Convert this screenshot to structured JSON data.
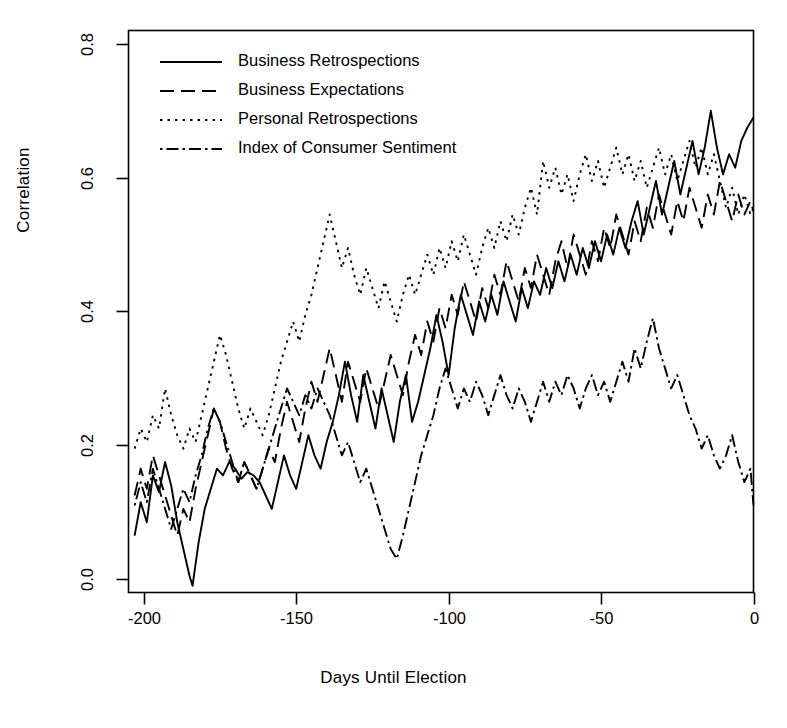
{
  "chart_data": {
    "type": "line",
    "title": "",
    "xlabel": "Days Until Election",
    "ylabel": "Correlation",
    "xlim": [
      -205,
      0
    ],
    "ylim": [
      -0.02,
      0.82
    ],
    "xticks": [
      -200,
      -150,
      -100,
      -50,
      0
    ],
    "xtick_labels": [
      "-200",
      "-150",
      "-100",
      "-50",
      "0"
    ],
    "yticks": [
      0.0,
      0.2,
      0.4,
      0.6,
      0.8
    ],
    "ytick_labels": [
      "0.0",
      "0.2",
      "0.4",
      "0.6",
      "0.8"
    ],
    "grid": false,
    "legend_position": "top-left",
    "line_color": "#000000",
    "series": [
      {
        "name": "Business Retrospections",
        "dash": "solid",
        "x": [
          -203,
          -201,
          -199,
          -197,
          -195,
          -193,
          -191,
          -189,
          -187,
          -185,
          -184,
          -182,
          -180,
          -178,
          -176,
          -174,
          -172,
          -170,
          -168,
          -166,
          -164,
          -162,
          -160,
          -158,
          -156,
          -154,
          -152,
          -150,
          -148,
          -146,
          -144,
          -142,
          -140,
          -138,
          -136,
          -134,
          -132,
          -130,
          -128,
          -126,
          -124,
          -122,
          -120,
          -118,
          -116,
          -114,
          -112,
          -110,
          -108,
          -106,
          -104,
          -102,
          -100,
          -98,
          -96,
          -94,
          -92,
          -90,
          -88,
          -86,
          -84,
          -82,
          -80,
          -78,
          -76,
          -74,
          -72,
          -70,
          -68,
          -66,
          -64,
          -62,
          -60,
          -58,
          -56,
          -54,
          -52,
          -50,
          -48,
          -46,
          -44,
          -42,
          -40,
          -38,
          -36,
          -34,
          -32,
          -30,
          -28,
          -26,
          -24,
          -22,
          -20,
          -18,
          -16,
          -14,
          -12,
          -10,
          -8,
          -6,
          -4,
          -2,
          0
        ],
        "y": [
          0.065,
          0.115,
          0.085,
          0.155,
          0.13,
          0.175,
          0.14,
          0.085,
          0.045,
          0.005,
          -0.01,
          0.055,
          0.105,
          0.135,
          0.165,
          0.155,
          0.175,
          0.165,
          0.15,
          0.16,
          0.155,
          0.145,
          0.125,
          0.105,
          0.145,
          0.185,
          0.155,
          0.135,
          0.175,
          0.215,
          0.185,
          0.165,
          0.205,
          0.235,
          0.275,
          0.325,
          0.275,
          0.235,
          0.305,
          0.265,
          0.225,
          0.285,
          0.245,
          0.205,
          0.265,
          0.305,
          0.235,
          0.265,
          0.305,
          0.345,
          0.395,
          0.355,
          0.305,
          0.375,
          0.425,
          0.395,
          0.365,
          0.415,
          0.385,
          0.425,
          0.395,
          0.445,
          0.415,
          0.385,
          0.435,
          0.405,
          0.445,
          0.425,
          0.465,
          0.435,
          0.475,
          0.445,
          0.485,
          0.455,
          0.495,
          0.465,
          0.505,
          0.475,
          0.515,
          0.485,
          0.525,
          0.495,
          0.535,
          0.565,
          0.515,
          0.555,
          0.595,
          0.545,
          0.585,
          0.625,
          0.575,
          0.615,
          0.655,
          0.605,
          0.645,
          0.7,
          0.645,
          0.605,
          0.635,
          0.615,
          0.655,
          0.675,
          0.69
        ]
      },
      {
        "name": "Business Expectations",
        "dash": "longdash",
        "x": [
          -203,
          -201,
          -199,
          -197,
          -195,
          -193,
          -191,
          -189,
          -187,
          -185,
          -183,
          -181,
          -179,
          -177,
          -175,
          -173,
          -171,
          -169,
          -167,
          -165,
          -163,
          -161,
          -159,
          -157,
          -155,
          -153,
          -151,
          -149,
          -147,
          -145,
          -143,
          -141,
          -139,
          -137,
          -135,
          -133,
          -131,
          -129,
          -127,
          -125,
          -123,
          -121,
          -119,
          -117,
          -115,
          -113,
          -111,
          -109,
          -107,
          -105,
          -103,
          -101,
          -99,
          -97,
          -95,
          -93,
          -91,
          -89,
          -87,
          -85,
          -83,
          -81,
          -79,
          -77,
          -75,
          -73,
          -71,
          -69,
          -67,
          -65,
          -63,
          -61,
          -59,
          -57,
          -55,
          -53,
          -51,
          -49,
          -47,
          -45,
          -43,
          -41,
          -39,
          -37,
          -35,
          -33,
          -31,
          -29,
          -27,
          -25,
          -23,
          -21,
          -19,
          -17,
          -15,
          -13,
          -11,
          -9,
          -7,
          -5,
          -3,
          -1,
          0
        ],
        "y": [
          0.125,
          0.165,
          0.135,
          0.185,
          0.155,
          0.125,
          0.095,
          0.065,
          0.105,
          0.085,
          0.135,
          0.175,
          0.215,
          0.255,
          0.235,
          0.195,
          0.165,
          0.145,
          0.175,
          0.155,
          0.135,
          0.165,
          0.195,
          0.175,
          0.225,
          0.265,
          0.235,
          0.205,
          0.255,
          0.295,
          0.265,
          0.305,
          0.345,
          0.305,
          0.265,
          0.325,
          0.295,
          0.265,
          0.315,
          0.285,
          0.255,
          0.295,
          0.335,
          0.305,
          0.275,
          0.325,
          0.365,
          0.335,
          0.385,
          0.355,
          0.405,
          0.375,
          0.425,
          0.395,
          0.445,
          0.415,
          0.385,
          0.435,
          0.405,
          0.455,
          0.425,
          0.475,
          0.445,
          0.415,
          0.465,
          0.435,
          0.485,
          0.455,
          0.425,
          0.475,
          0.505,
          0.465,
          0.515,
          0.485,
          0.455,
          0.505,
          0.475,
          0.525,
          0.495,
          0.545,
          0.515,
          0.485,
          0.535,
          0.505,
          0.555,
          0.525,
          0.575,
          0.545,
          0.515,
          0.565,
          0.535,
          0.585,
          0.555,
          0.525,
          0.575,
          0.545,
          0.595,
          0.565,
          0.535,
          0.575,
          0.545,
          0.565,
          0.55
        ]
      },
      {
        "name": "Personal Retrospections",
        "dash": "dotted",
        "x": [
          -203,
          -201,
          -199,
          -197,
          -195,
          -193,
          -191,
          -189,
          -187,
          -185,
          -183,
          -181,
          -179,
          -177,
          -175,
          -173,
          -171,
          -169,
          -167,
          -165,
          -163,
          -161,
          -159,
          -157,
          -155,
          -153,
          -151,
          -149,
          -147,
          -145,
          -143,
          -141,
          -139,
          -137,
          -135,
          -133,
          -131,
          -129,
          -127,
          -125,
          -123,
          -121,
          -119,
          -117,
          -115,
          -113,
          -111,
          -109,
          -107,
          -105,
          -103,
          -101,
          -99,
          -97,
          -95,
          -93,
          -91,
          -89,
          -87,
          -85,
          -83,
          -81,
          -79,
          -77,
          -75,
          -73,
          -71,
          -69,
          -67,
          -65,
          -63,
          -61,
          -59,
          -57,
          -55,
          -53,
          -51,
          -49,
          -47,
          -45,
          -43,
          -41,
          -39,
          -37,
          -35,
          -33,
          -31,
          -29,
          -27,
          -25,
          -23,
          -21,
          -19,
          -17,
          -15,
          -13,
          -11,
          -9,
          -7,
          -5,
          -3,
          -1,
          0
        ],
        "y": [
          0.195,
          0.225,
          0.205,
          0.245,
          0.225,
          0.285,
          0.245,
          0.215,
          0.195,
          0.225,
          0.205,
          0.245,
          0.285,
          0.325,
          0.365,
          0.335,
          0.295,
          0.255,
          0.225,
          0.255,
          0.235,
          0.215,
          0.245,
          0.285,
          0.325,
          0.355,
          0.385,
          0.355,
          0.395,
          0.425,
          0.465,
          0.505,
          0.545,
          0.505,
          0.465,
          0.495,
          0.455,
          0.425,
          0.465,
          0.435,
          0.405,
          0.445,
          0.415,
          0.385,
          0.425,
          0.455,
          0.425,
          0.455,
          0.485,
          0.455,
          0.495,
          0.465,
          0.505,
          0.475,
          0.515,
          0.485,
          0.455,
          0.495,
          0.525,
          0.495,
          0.535,
          0.505,
          0.545,
          0.515,
          0.555,
          0.585,
          0.545,
          0.625,
          0.585,
          0.615,
          0.575,
          0.605,
          0.565,
          0.605,
          0.635,
          0.595,
          0.625,
          0.585,
          0.615,
          0.645,
          0.605,
          0.635,
          0.595,
          0.625,
          0.585,
          0.615,
          0.645,
          0.605,
          0.635,
          0.595,
          0.625,
          0.655,
          0.615,
          0.645,
          0.605,
          0.635,
          0.595,
          0.555,
          0.585,
          0.545,
          0.575,
          0.545,
          0.555
        ]
      },
      {
        "name": "Index of Consumer Sentiment",
        "dash": "dashdot",
        "x": [
          -203,
          -201,
          -199,
          -197,
          -195,
          -193,
          -191,
          -189,
          -187,
          -185,
          -183,
          -181,
          -179,
          -177,
          -175,
          -173,
          -171,
          -169,
          -167,
          -165,
          -163,
          -161,
          -159,
          -157,
          -155,
          -153,
          -151,
          -149,
          -147,
          -145,
          -143,
          -141,
          -139,
          -137,
          -135,
          -133,
          -131,
          -129,
          -127,
          -125,
          -123,
          -121,
          -119,
          -117,
          -115,
          -113,
          -111,
          -109,
          -107,
          -105,
          -103,
          -101,
          -99,
          -97,
          -95,
          -93,
          -91,
          -89,
          -87,
          -85,
          -83,
          -81,
          -79,
          -77,
          -75,
          -73,
          -71,
          -69,
          -67,
          -65,
          -63,
          -61,
          -59,
          -57,
          -55,
          -53,
          -51,
          -49,
          -47,
          -45,
          -43,
          -41,
          -39,
          -37,
          -35,
          -33,
          -31,
          -29,
          -27,
          -25,
          -23,
          -21,
          -19,
          -17,
          -15,
          -13,
          -11,
          -9,
          -7,
          -5,
          -3,
          -1,
          0
        ],
        "y": [
          0.11,
          0.145,
          0.115,
          0.165,
          0.135,
          0.105,
          0.075,
          0.105,
          0.135,
          0.115,
          0.155,
          0.185,
          0.225,
          0.255,
          0.235,
          0.205,
          0.175,
          0.145,
          0.175,
          0.155,
          0.135,
          0.165,
          0.195,
          0.225,
          0.255,
          0.285,
          0.265,
          0.245,
          0.275,
          0.255,
          0.285,
          0.265,
          0.245,
          0.215,
          0.185,
          0.205,
          0.175,
          0.145,
          0.165,
          0.135,
          0.105,
          0.075,
          0.045,
          0.03,
          0.065,
          0.105,
          0.145,
          0.185,
          0.215,
          0.245,
          0.285,
          0.315,
          0.285,
          0.255,
          0.285,
          0.265,
          0.295,
          0.275,
          0.245,
          0.275,
          0.305,
          0.275,
          0.255,
          0.285,
          0.265,
          0.235,
          0.265,
          0.295,
          0.265,
          0.295,
          0.275,
          0.305,
          0.285,
          0.255,
          0.285,
          0.305,
          0.275,
          0.295,
          0.265,
          0.295,
          0.325,
          0.295,
          0.345,
          0.315,
          0.355,
          0.39,
          0.345,
          0.315,
          0.285,
          0.305,
          0.275,
          0.245,
          0.225,
          0.195,
          0.215,
          0.185,
          0.165,
          0.185,
          0.215,
          0.175,
          0.145,
          0.165,
          0.11
        ]
      }
    ]
  },
  "legend": {
    "entries": [
      {
        "label": "Business Retrospections",
        "dash": "solid"
      },
      {
        "label": "Business Expectations",
        "dash": "longdash"
      },
      {
        "label": "Personal Retrospections",
        "dash": "dotted"
      },
      {
        "label": "Index of Consumer Sentiment",
        "dash": "dashdot"
      }
    ]
  }
}
